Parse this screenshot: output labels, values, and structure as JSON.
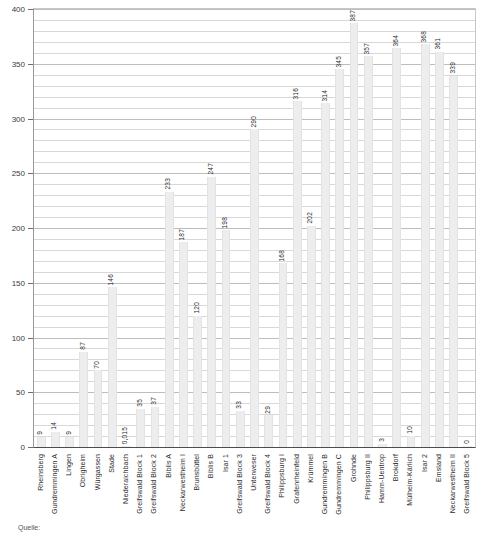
{
  "chart_data": {
    "type": "bar",
    "title": "",
    "subtitle": "",
    "xlabel": "",
    "ylabel": "",
    "ylim": [
      0,
      400
    ],
    "y_major_ticks": [
      0,
      50,
      100,
      150,
      200,
      250,
      300,
      350,
      400
    ],
    "y_minor_step": 10,
    "grid": true,
    "legend": "none",
    "orientation": "vertical",
    "bar_color": "#ededed",
    "label_color": "#2b2b2b",
    "categories": [
      "Rheinsberg",
      "Gundremmingen A",
      "Lingen",
      "Obrigheim",
      "Würgassen",
      "Stade",
      "Niederaichbach",
      "Greifswald Block 1",
      "Greifswald Block 2",
      "Biblis A",
      "Neckarwestheim I",
      "Brunsbüttel",
      "Biblis B",
      "Isar 1",
      "Greifswald Block 3",
      "Unterweser",
      "Greifswald Block 4",
      "Philippsburg I",
      "Grafenrheinfeld",
      "Krümmel",
      "Gundremmingen B",
      "Gundremmingen C",
      "Grohnde",
      "Philippsburg II",
      "Hamm-Uentrop",
      "Brokdorf",
      "Mülheim-Kärlich",
      "Isar 2",
      "Emsland",
      "Neckarwestheim II",
      "Greifswald Block 5"
    ],
    "values": [
      9,
      14,
      9,
      87,
      70,
      146,
      0.015,
      35,
      37,
      233,
      187,
      120,
      247,
      198,
      33,
      290,
      29,
      168,
      316,
      202,
      314,
      345,
      387,
      357,
      3,
      364,
      10,
      368,
      361,
      339,
      0
    ],
    "value_labels": [
      "9",
      "14",
      "9",
      "87",
      "70",
      "146",
      "0,015",
      "35",
      "37",
      "233",
      "187",
      "120",
      "247",
      "198",
      "33",
      "290",
      "29",
      "168",
      "316",
      "202",
      "314",
      "345",
      "387",
      "357",
      "3",
      "364",
      "10",
      "368",
      "361",
      "339",
      "0"
    ]
  },
  "axes": {
    "y_labels": [
      "400",
      "350",
      "300",
      "250",
      "200",
      "150",
      "100",
      "50",
      "0"
    ]
  },
  "footnote": {
    "text": "Quelle:"
  }
}
